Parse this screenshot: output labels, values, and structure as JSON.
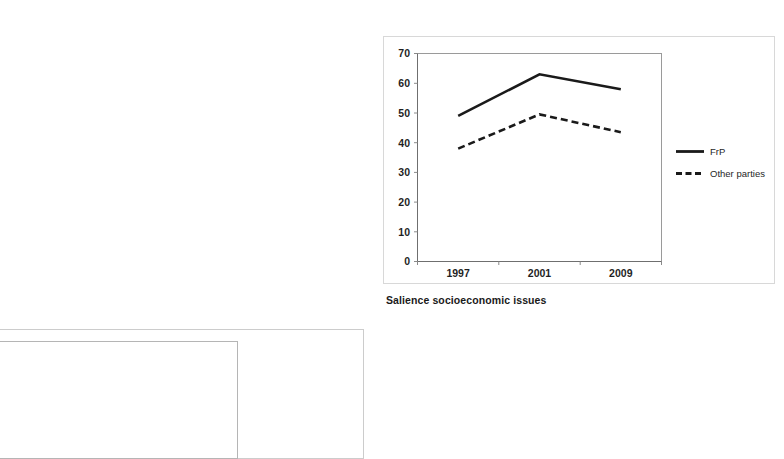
{
  "page": {
    "background_color": "#ffffff",
    "width": 784,
    "height": 432
  },
  "chart_caption": "Salience socioeconomic issues",
  "legend": {
    "position": "right",
    "entries": [
      {
        "label": "FrP",
        "style": "solid",
        "color": "#1a1a1a"
      },
      {
        "label": "Other parties",
        "style": "dashed",
        "color": "#1a1a1a"
      }
    ]
  },
  "axis": {
    "y_ticks": [
      "0",
      "10",
      "20",
      "30",
      "40",
      "50",
      "60",
      "70"
    ],
    "x_ticks": [
      "1997",
      "2001",
      "2009"
    ]
  },
  "chart_data": {
    "type": "line",
    "title": "Salience socioeconomic issues",
    "xlabel": "",
    "ylabel": "",
    "categories": [
      "1997",
      "2001",
      "2009"
    ],
    "series": [
      {
        "name": "FrP",
        "values": [
          49,
          63,
          58
        ],
        "style": "solid"
      },
      {
        "name": "Other parties",
        "values": [
          38,
          49.5,
          43.5
        ],
        "style": "dashed"
      }
    ],
    "ylim": [
      0,
      70
    ],
    "ytick_step": 10,
    "grid": false,
    "legend_position": "right"
  },
  "secondary_frames": {
    "note": "cropped empty chart frames at bottom-left",
    "count": 2
  }
}
